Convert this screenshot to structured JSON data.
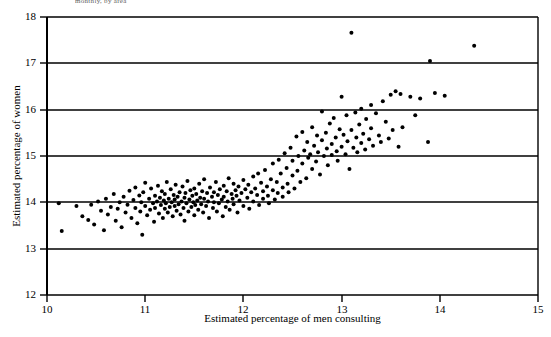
{
  "figure": {
    "title_fragment": "monthly, by area",
    "background": "#ffffff",
    "ink_color": "#000000"
  },
  "chart_data": {
    "type": "scatter",
    "title": "monthly, by area",
    "xlabel": "Estimated percentage of men consulting",
    "ylabel": "Estimated percentage of women",
    "xlim": [
      10,
      15
    ],
    "ylim": [
      12,
      18
    ],
    "xticks": [
      10,
      11,
      12,
      13,
      14,
      15
    ],
    "xticklabels": [
      "10",
      "11",
      "12",
      "13",
      "14",
      "15"
    ],
    "yticks": [
      12,
      13,
      14,
      15,
      16,
      17,
      18
    ],
    "yticklabels": [
      "12",
      "13",
      "14",
      "15",
      "16",
      "17",
      "18"
    ],
    "grid": "horizontal-gridlines-at-each-integer-y",
    "legend": null,
    "marker": {
      "shape": "circle",
      "color": "#000000",
      "size_px": 4
    },
    "n_points": 243,
    "points": [
      [
        10.12,
        13.98
      ],
      [
        10.15,
        13.38
      ],
      [
        10.3,
        13.92
      ],
      [
        10.36,
        13.7
      ],
      [
        10.42,
        13.62
      ],
      [
        10.45,
        13.95
      ],
      [
        10.48,
        13.52
      ],
      [
        10.52,
        14.02
      ],
      [
        10.55,
        13.82
      ],
      [
        10.58,
        13.4
      ],
      [
        10.6,
        14.08
      ],
      [
        10.62,
        13.74
      ],
      [
        10.65,
        13.9
      ],
      [
        10.68,
        14.18
      ],
      [
        10.7,
        13.6
      ],
      [
        10.72,
        13.86
      ],
      [
        10.74,
        14.0
      ],
      [
        10.76,
        13.46
      ],
      [
        10.78,
        14.12
      ],
      [
        10.8,
        13.78
      ],
      [
        10.82,
        13.95
      ],
      [
        10.84,
        14.25
      ],
      [
        10.86,
        13.66
      ],
      [
        10.88,
        14.05
      ],
      [
        10.9,
        13.88
      ],
      [
        10.9,
        14.32
      ],
      [
        10.92,
        13.55
      ],
      [
        10.94,
        14.15
      ],
      [
        10.95,
        13.8
      ],
      [
        10.96,
        14.0
      ],
      [
        10.97,
        13.3
      ],
      [
        10.98,
        14.22
      ],
      [
        11.0,
        13.92
      ],
      [
        11.0,
        14.42
      ],
      [
        11.02,
        13.72
      ],
      [
        11.04,
        14.08
      ],
      [
        11.05,
        13.84
      ],
      [
        11.06,
        14.3
      ],
      [
        11.08,
        13.98
      ],
      [
        11.09,
        13.58
      ],
      [
        11.1,
        14.14
      ],
      [
        11.1,
        13.88
      ],
      [
        11.12,
        14.02
      ],
      [
        11.13,
        14.36
      ],
      [
        11.14,
        13.76
      ],
      [
        11.15,
        14.1
      ],
      [
        11.16,
        13.94
      ],
      [
        11.17,
        14.24
      ],
      [
        11.18,
        13.66
      ],
      [
        11.19,
        14.04
      ],
      [
        11.2,
        13.86
      ],
      [
        11.2,
        14.18
      ],
      [
        11.21,
        13.98
      ],
      [
        11.22,
        14.44
      ],
      [
        11.23,
        13.78
      ],
      [
        11.24,
        14.08
      ],
      [
        11.25,
        13.9
      ],
      [
        11.26,
        14.28
      ],
      [
        11.27,
        14.0
      ],
      [
        11.28,
        13.7
      ],
      [
        11.29,
        14.16
      ],
      [
        11.3,
        13.92
      ],
      [
        11.3,
        14.06
      ],
      [
        11.31,
        14.38
      ],
      [
        11.32,
        13.82
      ],
      [
        11.33,
        14.12
      ],
      [
        11.34,
        13.96
      ],
      [
        11.35,
        14.22
      ],
      [
        11.36,
        13.74
      ],
      [
        11.37,
        14.02
      ],
      [
        11.38,
        14.34
      ],
      [
        11.39,
        13.88
      ],
      [
        11.4,
        14.1
      ],
      [
        11.4,
        13.6
      ],
      [
        11.41,
        14.2
      ],
      [
        11.42,
        13.98
      ],
      [
        11.43,
        14.46
      ],
      [
        11.44,
        13.8
      ],
      [
        11.45,
        14.06
      ],
      [
        11.46,
        14.26
      ],
      [
        11.47,
        13.9
      ],
      [
        11.48,
        14.14
      ],
      [
        11.49,
        14.0
      ],
      [
        11.5,
        13.72
      ],
      [
        11.5,
        14.3
      ],
      [
        11.51,
        13.94
      ],
      [
        11.52,
        14.18
      ],
      [
        11.53,
        14.04
      ],
      [
        11.54,
        13.84
      ],
      [
        11.55,
        14.4
      ],
      [
        11.56,
        14.1
      ],
      [
        11.57,
        13.96
      ],
      [
        11.58,
        14.24
      ],
      [
        11.59,
        13.78
      ],
      [
        11.6,
        14.08
      ],
      [
        11.6,
        14.5
      ],
      [
        11.62,
        13.92
      ],
      [
        11.63,
        14.2
      ],
      [
        11.64,
        14.02
      ],
      [
        11.65,
        13.66
      ],
      [
        11.66,
        14.32
      ],
      [
        11.68,
        14.12
      ],
      [
        11.69,
        13.88
      ],
      [
        11.7,
        14.22
      ],
      [
        11.7,
        14.0
      ],
      [
        11.72,
        14.44
      ],
      [
        11.73,
        13.8
      ],
      [
        11.74,
        14.16
      ],
      [
        11.75,
        13.98
      ],
      [
        11.76,
        14.28
      ],
      [
        11.78,
        14.06
      ],
      [
        11.79,
        13.7
      ],
      [
        11.8,
        14.36
      ],
      [
        11.8,
        14.12
      ],
      [
        11.82,
        13.9
      ],
      [
        11.83,
        14.24
      ],
      [
        11.84,
        14.02
      ],
      [
        11.85,
        14.52
      ],
      [
        11.86,
        13.84
      ],
      [
        11.88,
        14.18
      ],
      [
        11.89,
        14.08
      ],
      [
        11.9,
        14.4
      ],
      [
        11.9,
        13.96
      ],
      [
        11.92,
        14.26
      ],
      [
        11.93,
        14.14
      ],
      [
        11.94,
        13.78
      ],
      [
        11.95,
        14.34
      ],
      [
        11.96,
        14.04
      ],
      [
        11.98,
        14.2
      ],
      [
        12.0,
        14.48
      ],
      [
        12.0,
        13.92
      ],
      [
        12.02,
        14.28
      ],
      [
        12.04,
        14.1
      ],
      [
        12.05,
        14.38
      ],
      [
        12.06,
        13.86
      ],
      [
        12.08,
        14.22
      ],
      [
        12.1,
        14.56
      ],
      [
        12.1,
        14.02
      ],
      [
        12.12,
        14.3
      ],
      [
        12.14,
        14.16
      ],
      [
        12.15,
        14.62
      ],
      [
        12.16,
        13.94
      ],
      [
        12.18,
        14.42
      ],
      [
        12.2,
        14.24
      ],
      [
        12.2,
        14.08
      ],
      [
        12.22,
        14.7
      ],
      [
        12.24,
        14.34
      ],
      [
        12.25,
        14.14
      ],
      [
        12.26,
        13.98
      ],
      [
        12.28,
        14.5
      ],
      [
        12.3,
        14.26
      ],
      [
        12.3,
        14.84
      ],
      [
        12.32,
        14.06
      ],
      [
        12.34,
        14.44
      ],
      [
        12.35,
        14.2
      ],
      [
        12.36,
        14.92
      ],
      [
        12.38,
        14.62
      ],
      [
        12.4,
        14.32
      ],
      [
        12.4,
        14.12
      ],
      [
        12.42,
        15.06
      ],
      [
        12.44,
        14.74
      ],
      [
        12.45,
        14.4
      ],
      [
        12.46,
        14.22
      ],
      [
        12.48,
        15.18
      ],
      [
        12.5,
        14.58
      ],
      [
        12.5,
        14.9
      ],
      [
        12.52,
        14.3
      ],
      [
        12.54,
        15.42
      ],
      [
        12.55,
        14.68
      ],
      [
        12.56,
        15.0
      ],
      [
        12.58,
        14.44
      ],
      [
        12.6,
        15.52
      ],
      [
        12.6,
        14.84
      ],
      [
        12.62,
        15.12
      ],
      [
        12.64,
        14.52
      ],
      [
        12.65,
        15.3
      ],
      [
        12.66,
        14.96
      ],
      [
        12.68,
        15.04
      ],
      [
        12.7,
        15.62
      ],
      [
        12.7,
        14.72
      ],
      [
        12.72,
        15.22
      ],
      [
        12.74,
        14.88
      ],
      [
        12.75,
        15.44
      ],
      [
        12.76,
        15.08
      ],
      [
        12.78,
        14.6
      ],
      [
        12.8,
        15.34
      ],
      [
        12.8,
        15.96
      ],
      [
        12.82,
        15.0
      ],
      [
        12.84,
        15.5
      ],
      [
        12.85,
        15.16
      ],
      [
        12.86,
        14.8
      ],
      [
        12.88,
        15.7
      ],
      [
        12.9,
        15.26
      ],
      [
        12.9,
        15.02
      ],
      [
        12.92,
        15.82
      ],
      [
        12.94,
        15.4
      ],
      [
        12.95,
        15.1
      ],
      [
        12.96,
        14.9
      ],
      [
        12.98,
        15.58
      ],
      [
        13.0,
        16.28
      ],
      [
        13.0,
        15.2
      ],
      [
        13.02,
        15.46
      ],
      [
        13.04,
        15.04
      ],
      [
        13.05,
        15.88
      ],
      [
        13.06,
        15.32
      ],
      [
        13.08,
        14.72
      ],
      [
        13.1,
        17.66
      ],
      [
        13.1,
        15.56
      ],
      [
        13.12,
        15.18
      ],
      [
        13.14,
        15.94
      ],
      [
        13.15,
        15.4
      ],
      [
        13.16,
        15.08
      ],
      [
        13.18,
        15.68
      ],
      [
        13.2,
        15.28
      ],
      [
        13.2,
        16.02
      ],
      [
        13.22,
        15.48
      ],
      [
        13.24,
        15.14
      ],
      [
        13.25,
        15.8
      ],
      [
        13.28,
        15.36
      ],
      [
        13.3,
        15.6
      ],
      [
        13.3,
        16.1
      ],
      [
        13.32,
        15.22
      ],
      [
        13.35,
        15.92
      ],
      [
        13.38,
        15.44
      ],
      [
        13.4,
        15.3
      ],
      [
        13.42,
        16.18
      ],
      [
        13.45,
        15.74
      ],
      [
        13.48,
        15.38
      ],
      [
        13.5,
        16.32
      ],
      [
        13.52,
        15.56
      ],
      [
        13.55,
        16.4
      ],
      [
        13.58,
        15.2
      ],
      [
        13.6,
        16.34
      ],
      [
        13.62,
        15.62
      ],
      [
        13.7,
        16.28
      ],
      [
        13.75,
        15.88
      ],
      [
        13.8,
        16.24
      ],
      [
        13.88,
        15.3
      ],
      [
        13.9,
        17.05
      ],
      [
        13.95,
        16.36
      ],
      [
        14.05,
        16.3
      ],
      [
        14.35,
        17.38
      ]
    ]
  }
}
